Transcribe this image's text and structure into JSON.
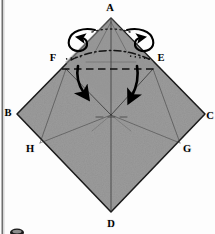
{
  "figure": {
    "kind": "origami-folding-diagram",
    "caption_marker": "",
    "paper_color": "#9b9b9b",
    "paper_edge_color": "#1c1c1c",
    "background_color": "#fdfdfd",
    "crease_color": "#2a2a2a",
    "arrow_color": "#000000",
    "scan_gutter_color": "#4a4a4a"
  },
  "labels": {
    "apex": {
      "text": "A",
      "x": 110,
      "y": 11
    },
    "left_inner": {
      "text": "F",
      "x": 53,
      "y": 61
    },
    "right_inner": {
      "text": "E",
      "x": 161,
      "y": 61
    },
    "left": {
      "text": "B",
      "x": 8,
      "y": 116
    },
    "right": {
      "text": "C",
      "x": 210,
      "y": 119
    },
    "left_lower": {
      "text": "H",
      "x": 30,
      "y": 152
    },
    "right_lower": {
      "text": "G",
      "x": 187,
      "y": 152
    },
    "bottom": {
      "text": "D",
      "x": 111,
      "y": 227
    }
  },
  "geometry": {
    "diamond": {
      "top": [
        111,
        18
      ],
      "right": [
        205,
        114
      ],
      "bottom": [
        111,
        212
      ],
      "left": [
        17,
        114
      ]
    },
    "inner_points": {
      "F": [
        65,
        64
      ],
      "E": [
        153,
        64
      ],
      "H": [
        40,
        143
      ],
      "G": [
        180,
        143
      ],
      "center": [
        111,
        114
      ]
    }
  },
  "creases": {
    "horizontal_valley": {
      "y": 68,
      "x1": 62,
      "x2": 158,
      "style": "dashed"
    },
    "upper_arc": {
      "style": "dash-dot",
      "description": "curved dash-dot crease above F-E line"
    },
    "vertical_center": {
      "x": 111,
      "y1": 18,
      "y2": 212,
      "style": "solid-thin"
    },
    "center_horizontal_hint": {
      "y": 117,
      "x1": 95,
      "x2": 128,
      "style": "dashed-faint"
    },
    "diagonal_left": {
      "from": [
        65,
        70
      ],
      "to": [
        111,
        116
      ],
      "style": "solid-thin"
    },
    "diagonal_right": {
      "from": [
        153,
        70
      ],
      "to": [
        111,
        116
      ],
      "style": "solid-thin"
    },
    "flap_left": {
      "from": [
        40,
        143
      ],
      "to": [
        111,
        114
      ]
    },
    "flap_right": {
      "from": [
        180,
        143
      ],
      "to": [
        111,
        114
      ]
    }
  },
  "arrows": {
    "fold_down_left": {
      "from": [
        80,
        67
      ],
      "to": [
        84,
        95
      ],
      "type": "valley-fold-arrow"
    },
    "fold_down_right": {
      "from": [
        136,
        67
      ],
      "to": [
        133,
        98
      ],
      "type": "valley-fold-arrow"
    },
    "curl_left": {
      "cx": 83,
      "cy": 36,
      "type": "curl-over-arrow"
    },
    "curl_right": {
      "cx": 139,
      "cy": 36,
      "type": "curl-over-arrow"
    }
  },
  "page_marker": {
    "visible": true,
    "x": 17,
    "y": 231
  }
}
